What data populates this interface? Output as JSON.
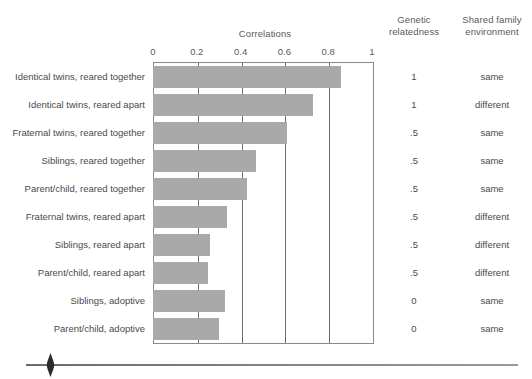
{
  "chart_data": {
    "type": "bar",
    "orientation": "horizontal",
    "title": "Correlations",
    "xlabel": "Correlations",
    "ylabel": "",
    "xlim": [
      0,
      1
    ],
    "xticks": [
      "0",
      "0.2",
      "0.4",
      "0.6",
      "0.8",
      "1"
    ],
    "xtick_values": [
      0,
      0.2,
      0.4,
      0.6,
      0.8,
      1
    ],
    "grid": "vertical gridlines at every 0.2",
    "legend": "none",
    "bar_color": "#a9a9a9",
    "categories": [
      "Identical twins, reared together",
      "Identical twins, reared apart",
      "Fraternal twins, reared together",
      "Siblings, reared together",
      "Parent/child, reared together",
      "Fraternal twins, reared apart",
      "Siblings, reared apart",
      "Parent/child, reared apart",
      "Siblings, adoptive",
      "Parent/child, adoptive"
    ],
    "values": [
      0.86,
      0.73,
      0.61,
      0.47,
      0.43,
      0.34,
      0.26,
      0.25,
      0.33,
      0.3
    ],
    "annotations": {
      "genetic_relatedness": [
        "1",
        "1",
        ".5",
        ".5",
        ".5",
        ".5",
        ".5",
        ".5",
        "0",
        "0"
      ],
      "shared_family_environment": [
        "same",
        "different",
        "same",
        "same",
        "same",
        "different",
        "different",
        "different",
        "same",
        "same"
      ]
    }
  },
  "headers": {
    "correlations": "Correlations",
    "genetic_relatedness_line1": "Genetic",
    "genetic_relatedness_line2": "relatedness",
    "shared_environment_line1": "Shared family",
    "shared_environment_line2": "environment"
  },
  "rows": [
    {
      "label": "Identical twins, reared together",
      "value": 0.86,
      "genetic": "1",
      "environment": "same"
    },
    {
      "label": "Identical twins, reared apart",
      "value": 0.73,
      "genetic": "1",
      "environment": "different"
    },
    {
      "label": "Fraternal twins, reared together",
      "value": 0.61,
      "genetic": ".5",
      "environment": "same"
    },
    {
      "label": "Siblings, reared together",
      "value": 0.47,
      "genetic": ".5",
      "environment": "same"
    },
    {
      "label": "Parent/child, reared together",
      "value": 0.43,
      "genetic": ".5",
      "environment": "same"
    },
    {
      "label": "Fraternal twins, reared apart",
      "value": 0.34,
      "genetic": ".5",
      "environment": "different"
    },
    {
      "label": "Siblings, reared apart",
      "value": 0.26,
      "genetic": ".5",
      "environment": "different"
    },
    {
      "label": "Parent/child, reared apart",
      "value": 0.25,
      "genetic": ".5",
      "environment": "different"
    },
    {
      "label": "Siblings, adoptive",
      "value": 0.33,
      "genetic": "0",
      "environment": "same"
    },
    {
      "label": "Parent/child, adoptive",
      "value": 0.3,
      "genetic": "0",
      "environment": "same"
    }
  ],
  "colors": {
    "bar": "#a9a9a9",
    "gridline": "#6d6d6d",
    "frame": "#8a8a8a",
    "text": "#4a4a4a"
  }
}
